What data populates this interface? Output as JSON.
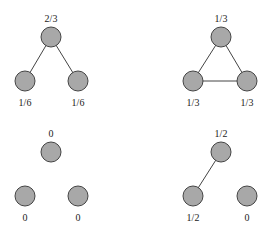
{
  "colors": {
    "node_fill": "#a8a8a8",
    "node_stroke": "#444444",
    "edge": "#444444",
    "text": "#222222"
  },
  "graphs": [
    {
      "name": "path-graph",
      "labels": [
        "2/3",
        "1/6",
        "1/6"
      ]
    },
    {
      "name": "triangle-graph",
      "labels": [
        "1/3",
        "1/3",
        "1/3"
      ]
    },
    {
      "name": "empty-graph",
      "labels": [
        "0",
        "0",
        "0"
      ]
    },
    {
      "name": "single-edge-graph",
      "labels": [
        "1/2",
        "1/2",
        "0"
      ]
    }
  ]
}
